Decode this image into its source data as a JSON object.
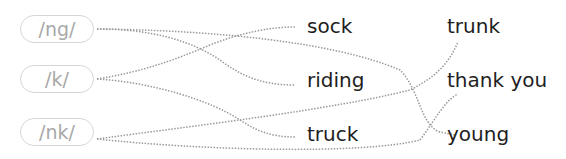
{
  "sounds": [
    {
      "label": "/ng/"
    },
    {
      "label": "/k/"
    },
    {
      "label": "/nk/"
    }
  ],
  "words_col1": [
    {
      "label": "sock"
    },
    {
      "label": "riding"
    },
    {
      "label": "truck"
    }
  ],
  "words_col2": [
    {
      "label": "trunk"
    },
    {
      "label": "thank you"
    },
    {
      "label": "young"
    }
  ],
  "connections": [
    {
      "from": "/ng/",
      "to": "riding"
    },
    {
      "from": "/ng/",
      "to": "young"
    },
    {
      "from": "/k/",
      "to": "sock"
    },
    {
      "from": "/k/",
      "to": "truck"
    },
    {
      "from": "/nk/",
      "to": "trunk"
    },
    {
      "from": "/nk/",
      "to": "thank you"
    }
  ],
  "colors": {
    "pill_border": "#d6d6d6",
    "pill_text": "#a8a8a8",
    "word_text": "#1e1e1e",
    "line": "#9a9a9a"
  }
}
